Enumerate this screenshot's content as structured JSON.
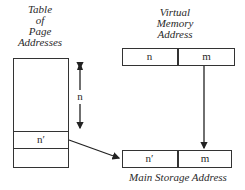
{
  "table_label": [
    "Table",
    "of",
    "Page",
    "Addresses"
  ],
  "vma_label": [
    "Virtual",
    "Memory",
    "Address"
  ],
  "vma_cells": {
    "n": "n",
    "m": "m"
  },
  "table_entry": "n′",
  "offset_label": "n",
  "main_cells": {
    "n_prime": "n′",
    "m": "m"
  },
  "main_label": "Main Storage Address"
}
